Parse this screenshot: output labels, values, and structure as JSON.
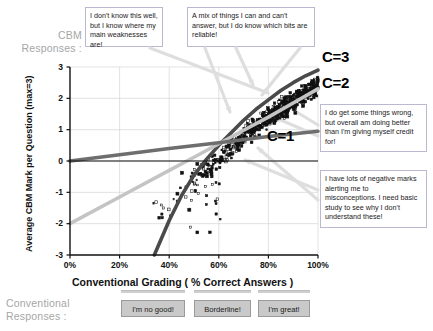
{
  "labels": {
    "cbm_responses": "CBM\nResponses :",
    "conventional_responses": "Conventional\nResponses :"
  },
  "callouts": [
    {
      "id": "callout-low-confidence",
      "text": "I don't know this well, but I know where my main weaknesses are!"
    },
    {
      "id": "callout-mixed",
      "text": "A mix of things I can and can't answer, but I do know which bits are reliable!"
    },
    {
      "id": "callout-underconfident",
      "text": "I do get some things wrong, but overall am doing better than I'm giving myself credit for!"
    },
    {
      "id": "callout-misconceptions",
      "text": "I have lots of negative marks alerting me to misconceptions. I need basic study to see why I don't understand these!"
    }
  ],
  "curve_labels": [
    {
      "name": "C=3",
      "color": "#4a4a4a"
    },
    {
      "name": "C=2",
      "color": "#c4c4c4"
    },
    {
      "name": "C=1",
      "color": "#6e6e6e"
    }
  ],
  "buttons": [
    {
      "label": "I'm no good!"
    },
    {
      "label": "Borderline!"
    },
    {
      "label": "I'm great!"
    }
  ],
  "chart_data": {
    "type": "scatter",
    "title": "",
    "xlabel": "Conventional Grading ( % Correct Answers )",
    "ylabel": "Average CBM Mark per Question (max=3)",
    "xlim": [
      0,
      100
    ],
    "ylim": [
      -3,
      3
    ],
    "xticks": [
      "0%",
      "20%",
      "40%",
      "60%",
      "80%",
      "100%"
    ],
    "xtick_values": [
      0,
      20,
      40,
      60,
      80,
      100
    ],
    "yticks": [
      "3",
      "2",
      "1",
      "0",
      "-1",
      "-2",
      "-3"
    ],
    "ytick_values": [
      3,
      2,
      1,
      0,
      -1,
      -2,
      -3
    ],
    "grid": true,
    "legend": "none",
    "series": [
      {
        "name": "C=3",
        "type": "line",
        "color": "#4a4a4a",
        "description": "Confidence level 3 reference curve: steep rise from -3 at 34% to 2.9 at 100%",
        "points": [
          [
            34,
            -3
          ],
          [
            40,
            -1.9
          ],
          [
            45,
            -1.1
          ],
          [
            50,
            -0.45
          ],
          [
            55,
            0.05
          ],
          [
            60,
            0.5
          ],
          [
            65,
            0.9
          ],
          [
            70,
            1.3
          ],
          [
            75,
            1.65
          ],
          [
            80,
            1.95
          ],
          [
            85,
            2.25
          ],
          [
            90,
            2.5
          ],
          [
            95,
            2.72
          ],
          [
            100,
            2.9
          ]
        ]
      },
      {
        "name": "C=2",
        "type": "line",
        "color": "#c4c4c4",
        "description": "Confidence level 2 reference curve: linear rise from -2 at 0% to 2.3 at 100%",
        "points": [
          [
            0,
            -2.0
          ],
          [
            20,
            -1.15
          ],
          [
            40,
            -0.3
          ],
          [
            50,
            0.12
          ],
          [
            60,
            0.55
          ],
          [
            70,
            0.98
          ],
          [
            80,
            1.4
          ],
          [
            90,
            1.85
          ],
          [
            100,
            2.3
          ]
        ]
      },
      {
        "name": "C=1",
        "type": "line",
        "color": "#6e6e6e",
        "description": "Confidence level 1 reference curve: shallow rise from 0.0 at 0% to 0.95 at 100%",
        "points": [
          [
            0,
            0.0
          ],
          [
            20,
            0.2
          ],
          [
            40,
            0.4
          ],
          [
            60,
            0.58
          ],
          [
            80,
            0.78
          ],
          [
            100,
            0.95
          ]
        ]
      },
      {
        "name": "students",
        "type": "scatter",
        "color": "#111111",
        "description": "Dense cloud of student results, one point per student; rises from around (40%, -1.5) to (100%, 2.9), concentrated between 55% and 100% correct",
        "n_points": 620
      }
    ],
    "annotations": [
      {
        "text": "C=3",
        "x": 104,
        "y": 2.75
      },
      {
        "text": "C=2",
        "x": 104,
        "y": 2.05
      },
      {
        "text": "C=1",
        "x": 78,
        "y": 0.55
      }
    ]
  }
}
